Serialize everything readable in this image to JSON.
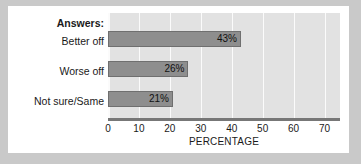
{
  "chart_data": {
    "type": "bar",
    "orientation": "horizontal",
    "title": "",
    "legend_header": "Answers:",
    "categories": [
      "Better off",
      "Worse off",
      "Not sure/Same"
    ],
    "values": [
      43,
      26,
      21
    ],
    "data_labels": [
      "43%",
      "26%",
      "21%"
    ],
    "xlabel": "PERCENTAGE",
    "ylabel": "",
    "xlim": [
      0,
      75
    ],
    "xticks": [
      0,
      10,
      20,
      30,
      40,
      50,
      60,
      70
    ],
    "xtick_labels": [
      "0",
      "10",
      "20",
      "30",
      "40",
      "50",
      "60",
      "70"
    ],
    "grid": "vertical",
    "legend_position": "none",
    "colors": {
      "bar_fill": "#8e8e8e",
      "bar_border": "#6f6f6f",
      "plot_background": "#e2e2e2",
      "gridline": "#fbfbfb",
      "axis_line": "#777777",
      "card_background": "#ffffff",
      "page_background": "#c9c9c9",
      "text": "#1a1a1a"
    }
  }
}
